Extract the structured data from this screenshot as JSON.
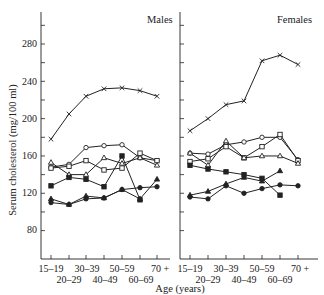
{
  "chart_data": [
    {
      "type": "line",
      "title": "Males",
      "xlabel": "Age (years)",
      "ylabel": "Serum cholesterol (mg/100 ml)",
      "categories": [
        "15–19",
        "20–29",
        "30–39",
        "40–49",
        "50–59",
        "60–69",
        "70 +"
      ],
      "yticks": [
        80,
        120,
        160,
        200,
        240,
        280
      ],
      "ylim": [
        60,
        310
      ],
      "grid": false,
      "series": [
        {
          "name": "series-x",
          "marker": "x",
          "values": [
            178,
            205,
            224,
            232,
            233,
            230,
            224
          ]
        },
        {
          "name": "series-open-circle",
          "marker": "open-circle",
          "values": [
            148,
            151,
            169,
            171,
            172,
            158,
            155
          ]
        },
        {
          "name": "series-open-square",
          "marker": "open-square",
          "values": [
            147,
            149,
            155,
            145,
            147,
            163,
            155
          ]
        },
        {
          "name": "series-open-triangle",
          "marker": "open-triangle",
          "values": [
            153,
            140,
            140,
            158,
            152,
            158,
            150
          ]
        },
        {
          "name": "series-filled-square",
          "marker": "filled-square",
          "values": [
            128,
            137,
            135,
            127,
            160,
            113,
            null
          ]
        },
        {
          "name": "series-filled-triangle",
          "marker": "filled-triangle",
          "values": [
            114,
            108,
            117,
            115,
            124,
            114,
            135
          ]
        },
        {
          "name": "series-filled-circle",
          "marker": "filled-circle",
          "values": [
            110,
            108,
            114,
            115,
            124,
            126,
            127
          ]
        }
      ]
    },
    {
      "type": "line",
      "title": "Females",
      "xlabel": "Age (years)",
      "ylabel": "Serum cholesterol (mg/100 ml)",
      "categories": [
        "15–19",
        "20–29",
        "30–39",
        "40–49",
        "50–59",
        "60–69",
        "70 +"
      ],
      "yticks": [
        80,
        120,
        160,
        200,
        240,
        280
      ],
      "ylim": [
        60,
        310
      ],
      "grid": false,
      "series": [
        {
          "name": "series-x",
          "marker": "x",
          "values": [
            187,
            200,
            215,
            219,
            262,
            268,
            258
          ]
        },
        {
          "name": "series-open-circle",
          "marker": "open-circle",
          "values": [
            163,
            162,
            172,
            175,
            180,
            180,
            156
          ]
        },
        {
          "name": "series-open-square",
          "marker": "open-square",
          "values": [
            154,
            157,
            170,
            158,
            170,
            183,
            155
          ]
        },
        {
          "name": "series-open-triangle",
          "marker": "open-triangle",
          "values": [
            163,
            150,
            176,
            158,
            160,
            160,
            152
          ]
        },
        {
          "name": "series-filled-square",
          "marker": "filled-square",
          "values": [
            150,
            146,
            143,
            140,
            136,
            118,
            null
          ]
        },
        {
          "name": "series-filled-triangle",
          "marker": "filled-triangle",
          "values": [
            118,
            122,
            130,
            137,
            133,
            144,
            null
          ]
        },
        {
          "name": "series-filled-circle",
          "marker": "filled-circle",
          "values": [
            116,
            114,
            128,
            120,
            125,
            129,
            128
          ]
        }
      ]
    }
  ],
  "labels": {
    "males_title": "Males",
    "females_title": "Females",
    "ylabel": "Serum cholesterol (mg/100 ml)",
    "xlabel": "Age (years)",
    "ytick_labels": [
      "280",
      "240",
      "200",
      "160",
      "120",
      "80"
    ],
    "xtick_top": [
      "15–19",
      "30–39",
      "50–59",
      "70 +"
    ],
    "xtick_bottom": [
      "20–29",
      "40–49",
      "60–69"
    ]
  },
  "colors": {
    "ink": "#222222",
    "background": "#ffffff"
  }
}
